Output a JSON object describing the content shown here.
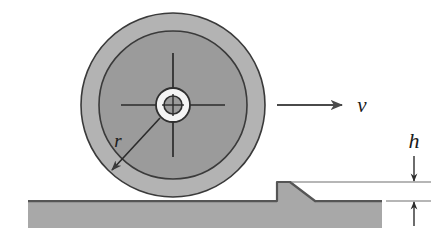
{
  "figure": {
    "background_color": "#ffffff"
  },
  "labels": {
    "radius": "r",
    "velocity": "v",
    "height": "h"
  },
  "colors": {
    "outer_tire": "#b0b0b0",
    "inner_disc": "#9a9a9a",
    "hub_ring": "#f2f2f2",
    "hub_center": "#9a9a9a",
    "ground": "#a8a8a8",
    "outline": "#333333",
    "line": "#4a4a4a"
  },
  "wheel": {
    "center_x": 173,
    "center_y": 105,
    "outer_radius": 92,
    "inner_radius": 74,
    "hub_outer_radius": 17,
    "hub_inner_radius": 9,
    "crosshair_half_length": 52
  },
  "ground": {
    "top_y": 201,
    "left_x": 28,
    "right_x": 382,
    "bottom_y": 228
  },
  "step": {
    "left_x": 277,
    "top_y": 182,
    "slope_start_x": 290,
    "slope_end_x": 315,
    "base_y": 201
  },
  "velocity_arrow": {
    "start_x": 277,
    "end_x": 342,
    "y": 105
  },
  "height_dimension": {
    "upper_line_y": 182,
    "lower_line_y": 201,
    "arrow_x": 414,
    "label_y": 148
  },
  "radius_arrow": {
    "start_x": 160,
    "start_y": 118,
    "end_x": 112,
    "end_y": 170,
    "label_x": 118,
    "label_y": 143
  }
}
